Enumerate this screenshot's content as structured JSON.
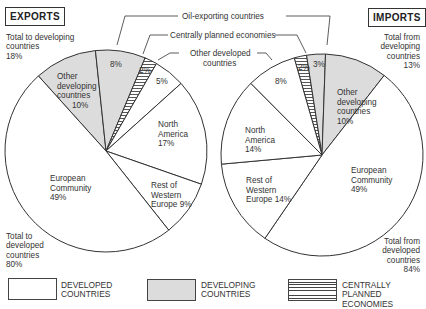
{
  "chart_data": [
    {
      "type": "pie",
      "title": "EXPORTS",
      "slices": [
        {
          "label": "Other developing countries",
          "value": 10,
          "group": "developing"
        },
        {
          "label": "Oil-exporting countries",
          "value": 8,
          "group": "developing"
        },
        {
          "label": "Centrally planned economies",
          "value": 2,
          "group": "centrally_planned"
        },
        {
          "label": "Other developed countries",
          "value": 5,
          "group": "developed"
        },
        {
          "label": "North America",
          "value": 17,
          "group": "developed"
        },
        {
          "label": "Rest of Western Europe",
          "value": 9,
          "group": "developed"
        },
        {
          "label": "European Community",
          "value": 49,
          "group": "developed"
        }
      ],
      "totals": [
        {
          "label": "Total to developing countries",
          "value": 18
        },
        {
          "label": "Total to developed countries",
          "value": 80
        }
      ]
    },
    {
      "type": "pie",
      "title": "IMPORTS",
      "slices": [
        {
          "label": "Centrally planned economies",
          "value": 2,
          "group": "centrally_planned"
        },
        {
          "label": "Oil-exporting countries",
          "value": 3,
          "group": "developing"
        },
        {
          "label": "Other developing countries",
          "value": 10,
          "group": "developing"
        },
        {
          "label": "European Community",
          "value": 49,
          "group": "developed"
        },
        {
          "label": "Rest of Western Europe",
          "value": 14,
          "group": "developed"
        },
        {
          "label": "North America",
          "value": 14,
          "group": "developed"
        },
        {
          "label": "Other developed countries",
          "value": 8,
          "group": "developed"
        }
      ],
      "totals": [
        {
          "label": "Total from developing countries",
          "value": 13
        },
        {
          "label": "Total from developed countries",
          "value": 84
        }
      ]
    }
  ],
  "titles": {
    "exports": "EXPORTS",
    "imports": "IMPORTS"
  },
  "callouts": {
    "oil": "Oil-exporting countries",
    "cpe": "Centrally planned economies",
    "other_dev_1": "Other developed",
    "other_dev_2": "countries"
  },
  "exports_notes": {
    "developing": [
      "Total to developing",
      "countries",
      "18%"
    ],
    "developed": [
      "Total to",
      "developed",
      "countries",
      "80%"
    ]
  },
  "imports_notes": {
    "developing": [
      "Total from",
      "developing",
      "countries",
      "13%"
    ],
    "developed": [
      "Total from",
      "developed",
      "countries",
      "84%"
    ]
  },
  "exports_labels": {
    "other_developing": [
      "Other",
      "developing",
      "countries",
      "10%"
    ],
    "oil": "8%",
    "cpe": "2%",
    "other_developed": "5%",
    "north_america": [
      "North",
      "America",
      "17%"
    ],
    "rwe": [
      "Rest of",
      "Western",
      "Europe  9%"
    ],
    "ec": [
      "European",
      "Community",
      "49%"
    ]
  },
  "imports_labels": {
    "other_developing": [
      "Other",
      "developing",
      "countries",
      "10%"
    ],
    "oil": "3%",
    "cpe": "2%",
    "other_developed": "8%",
    "north_america": [
      "North",
      "America",
      "14%"
    ],
    "rwe": [
      "Rest of",
      "Western",
      "Europe 14%"
    ],
    "ec": [
      "European",
      "Community",
      "49%"
    ]
  },
  "legend": [
    {
      "key": "developed",
      "lines": [
        "DEVELOPED",
        "COUNTRIES"
      ]
    },
    {
      "key": "developing",
      "lines": [
        "DEVELOPING",
        "COUNTRIES"
      ]
    },
    {
      "key": "centrally_planned",
      "lines": [
        "CENTRALLY",
        "PLANNED ECONOMIES"
      ]
    }
  ],
  "colors": {
    "developed": "#ffffff",
    "developing": "#dcdcdc",
    "outline": "#333333",
    "hatch": "#444444"
  }
}
